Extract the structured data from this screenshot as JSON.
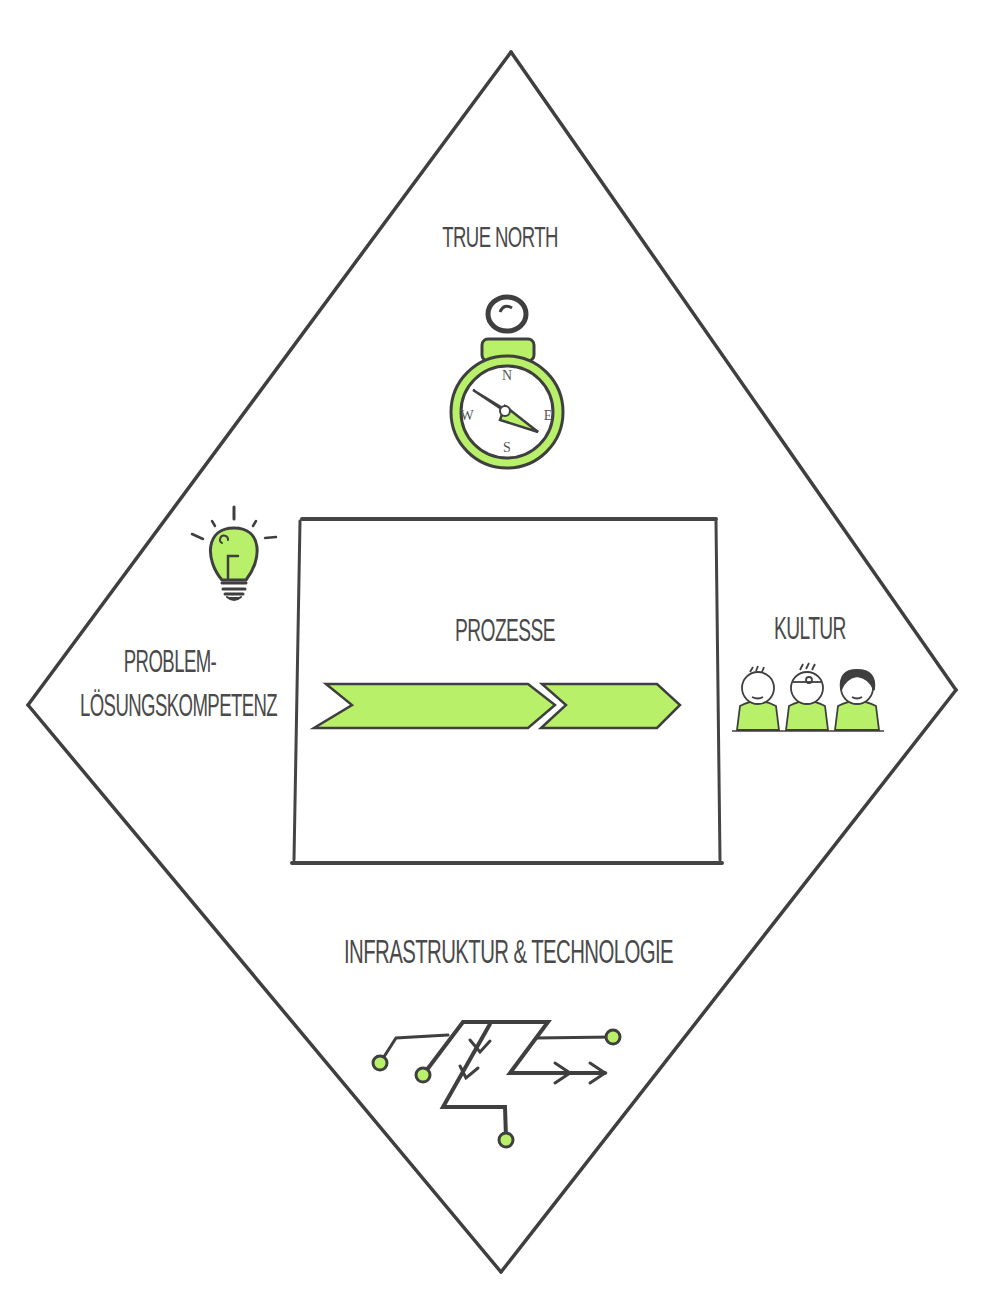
{
  "diagram": {
    "type": "diamond-framework",
    "colors": {
      "accent_green": "#b9f06a",
      "line_dark": "#3f3f3f",
      "text": "#4a4a4a",
      "background": "#ffffff"
    },
    "top": {
      "label": "True North",
      "icon": "compass-icon",
      "compass_letters": {
        "n": "N",
        "e": "E",
        "s": "S",
        "w": "W"
      }
    },
    "left": {
      "label_line1": "Problem-",
      "label_line2": "Lösungskompetenz",
      "icon": "lightbulb-icon"
    },
    "center": {
      "label": "Prozesse",
      "icon": "process-arrows-icon"
    },
    "right": {
      "label": "Kultur",
      "icon": "people-group-icon"
    },
    "bottom": {
      "label": "Infrastruktur & Technologie",
      "icon": "circuit-icon"
    }
  }
}
